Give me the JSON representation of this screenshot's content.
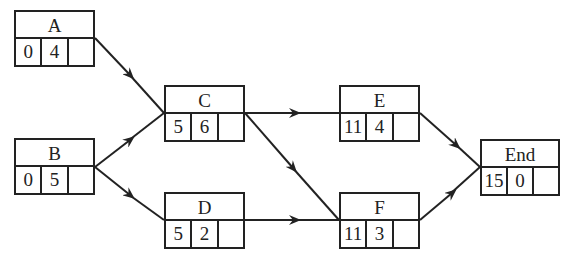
{
  "nodes": {
    "A": {
      "label": "A",
      "es": "0",
      "dur": "4",
      "extra": ""
    },
    "B": {
      "label": "B",
      "es": "0",
      "dur": "5",
      "extra": ""
    },
    "C": {
      "label": "C",
      "es": "5",
      "dur": "6",
      "extra": ""
    },
    "D": {
      "label": "D",
      "es": "5",
      "dur": "2",
      "extra": ""
    },
    "E": {
      "label": "E",
      "es": "11",
      "dur": "4",
      "extra": ""
    },
    "F": {
      "label": "F",
      "es": "11",
      "dur": "3",
      "extra": ""
    },
    "End": {
      "label": "End",
      "es": "15",
      "dur": "0",
      "extra": ""
    }
  },
  "edges": [
    [
      "A",
      "C"
    ],
    [
      "B",
      "C"
    ],
    [
      "B",
      "D"
    ],
    [
      "C",
      "E"
    ],
    [
      "C",
      "F"
    ],
    [
      "D",
      "F"
    ],
    [
      "E",
      "End"
    ],
    [
      "F",
      "End"
    ]
  ]
}
